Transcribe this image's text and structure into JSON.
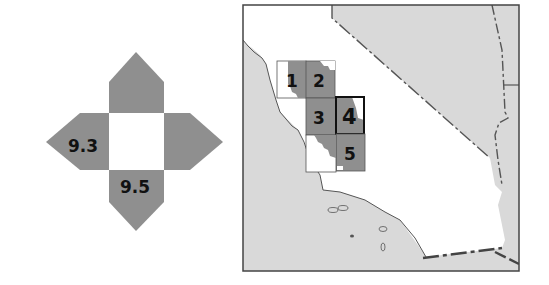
{
  "colors": {
    "arm_fill": "#8f8f8f",
    "center_fill": "#ffffff",
    "land_other": "#d9d9d9",
    "land_focus": "#ffffff",
    "tile_fill": "#8f8f8f",
    "outline": "#333333"
  },
  "stencil": {
    "labels": {
      "left": "9.3",
      "bottom": "9.5",
      "top": "",
      "right": ""
    }
  },
  "map": {
    "tiles": [
      {
        "id": "1",
        "label": "1",
        "highlighted": false
      },
      {
        "id": "2",
        "label": "2",
        "highlighted": false
      },
      {
        "id": "3",
        "label": "3",
        "highlighted": false
      },
      {
        "id": "4",
        "label": "4",
        "highlighted": true
      },
      {
        "id": "5",
        "label": "5",
        "highlighted": false
      }
    ]
  }
}
